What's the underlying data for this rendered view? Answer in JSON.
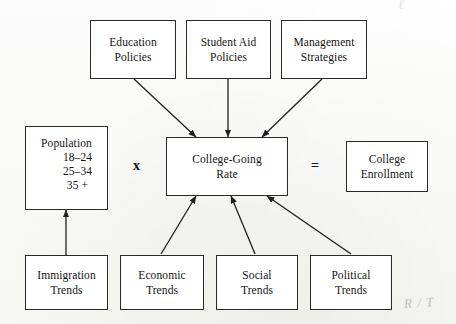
{
  "diagram": {
    "operators": {
      "multiply": "x",
      "equals": "="
    },
    "nodes": [
      {
        "id": "education_policies",
        "lines": [
          "Education",
          "Policies"
        ]
      },
      {
        "id": "student_aid_policies",
        "lines": [
          "Student Aid",
          "Policies"
        ]
      },
      {
        "id": "management_strategies",
        "lines": [
          "Management",
          "Strategies"
        ]
      },
      {
        "id": "population",
        "heading": "Population",
        "ages": [
          "18–24",
          "25–34",
          "35 +"
        ]
      },
      {
        "id": "college_going_rate",
        "lines": [
          "College-Going",
          "Rate"
        ]
      },
      {
        "id": "college_enrollment",
        "lines": [
          "College",
          "Enrollment"
        ]
      },
      {
        "id": "immigration_trends",
        "lines": [
          "Immigration",
          "Trends"
        ]
      },
      {
        "id": "economic_trends",
        "lines": [
          "Economic",
          "Trends"
        ]
      },
      {
        "id": "social_trends",
        "lines": [
          "Social",
          "Trends"
        ]
      },
      {
        "id": "political_trends",
        "lines": [
          "Political",
          "Trends"
        ]
      }
    ],
    "annotations": {
      "top_right_mark": "ℓ",
      "bottom_right_mark": "R / T"
    },
    "colors": {
      "box_border": "#2a2a2a",
      "arrow": "#1f1f1f",
      "text": "#141414",
      "page": "#fdfdfb",
      "annotation": "#9a9a9a"
    }
  }
}
